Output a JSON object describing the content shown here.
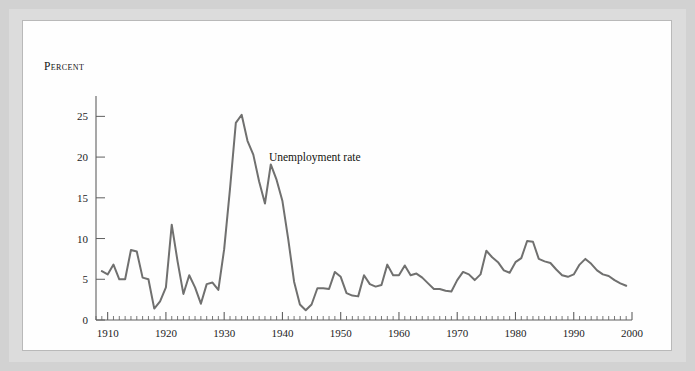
{
  "figure": {
    "background_color": "#d2d2d2",
    "mat_color": "#dcdcdc",
    "plate_color": "#fefefe",
    "border_color": "#b9b9b9"
  },
  "chart_data": {
    "type": "line",
    "title": "",
    "xlabel": "",
    "ylabel": "Percent",
    "ylabel_display": "Percent",
    "xlim": [
      1908,
      2000
    ],
    "ylim": [
      0,
      27.5
    ],
    "grid": false,
    "legend_position": "inline-annotation",
    "line_color": "#70706f",
    "axis_color": "#5f5f5f",
    "yticks": [
      0,
      5,
      10,
      15,
      20,
      25
    ],
    "ytick_labels": [
      "0",
      "5",
      "10",
      "15",
      "20",
      "25"
    ],
    "xticks": [
      1910,
      1920,
      1930,
      1940,
      1950,
      1960,
      1970,
      1980,
      1990,
      2000
    ],
    "xtick_labels": [
      "1910",
      "1920",
      "1930",
      "1940",
      "1950",
      "1960",
      "1970",
      "1980",
      "1990",
      "2000"
    ],
    "minor_xtick_step": 1,
    "annotations": [
      {
        "text": "Unemployment rate",
        "x": 1937,
        "y": 19.5
      }
    ],
    "series": [
      {
        "name": "Unemployment rate",
        "color": "#70706f",
        "x": [
          1909,
          1910,
          1911,
          1912,
          1913,
          1914,
          1915,
          1916,
          1917,
          1918,
          1919,
          1920,
          1921,
          1922,
          1923,
          1924,
          1925,
          1926,
          1927,
          1928,
          1929,
          1930,
          1931,
          1932,
          1933,
          1934,
          1935,
          1936,
          1937,
          1938,
          1939,
          1940,
          1941,
          1942,
          1943,
          1944,
          1945,
          1946,
          1947,
          1948,
          1949,
          1950,
          1951,
          1952,
          1953,
          1954,
          1955,
          1956,
          1957,
          1958,
          1959,
          1960,
          1961,
          1962,
          1963,
          1964,
          1965,
          1966,
          1967,
          1968,
          1969,
          1970,
          1971,
          1972,
          1973,
          1974,
          1975,
          1976,
          1977,
          1978,
          1979,
          1980,
          1981,
          1982,
          1983,
          1984,
          1985,
          1986,
          1987,
          1988,
          1989,
          1990,
          1991,
          1992,
          1993,
          1994,
          1995,
          1996,
          1997,
          1998,
          1999
        ],
        "values": [
          6.0,
          5.6,
          6.8,
          5.0,
          5.0,
          8.6,
          8.4,
          5.2,
          5.0,
          1.4,
          2.3,
          4.0,
          11.7,
          7.2,
          3.2,
          5.5,
          4.0,
          2.0,
          4.4,
          4.6,
          3.7,
          8.7,
          16.1,
          24.2,
          25.2,
          22.0,
          20.3,
          17.0,
          14.3,
          19.1,
          17.2,
          14.6,
          9.9,
          4.7,
          1.9,
          1.2,
          1.9,
          3.9,
          3.9,
          3.8,
          5.9,
          5.3,
          3.3,
          3.0,
          2.9,
          5.5,
          4.4,
          4.1,
          4.3,
          6.8,
          5.5,
          5.5,
          6.7,
          5.5,
          5.7,
          5.2,
          4.5,
          3.8,
          3.8,
          3.6,
          3.5,
          4.9,
          5.9,
          5.6,
          4.9,
          5.6,
          8.5,
          7.7,
          7.1,
          6.1,
          5.8,
          7.1,
          7.6,
          9.7,
          9.6,
          7.5,
          7.2,
          7.0,
          6.2,
          5.5,
          5.3,
          5.6,
          6.8,
          7.5,
          6.9,
          6.1,
          5.6,
          5.4,
          4.9,
          4.5,
          4.2
        ]
      }
    ]
  }
}
